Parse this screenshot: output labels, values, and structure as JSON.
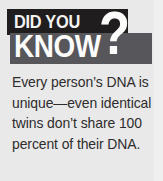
{
  "callout": {
    "kicker": "DID YOU",
    "headline": "KNOW",
    "question_mark": "?",
    "body_lines": [
      "Every person’s DNA is",
      "unique—even identical",
      "twins don’t share 100",
      "percent of their DNA."
    ],
    "body_full": "Every person’s DNA is unique—even identical twins don’t share 100 percent of their DNA.",
    "colors": {
      "background": "#e9e9e9",
      "band_black": "#201d1e",
      "band_gray": "#57565a",
      "header_text": "#fbfbfa",
      "body_text": "#2e2c2d"
    }
  }
}
